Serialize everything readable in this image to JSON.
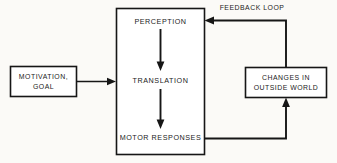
{
  "diagram": {
    "background_color": "#fbfaf7",
    "line_color": "#161616",
    "box_fill": "#ffffff",
    "boxes": {
      "motivation": {
        "line1": "MOTIVATION,",
        "line2": "GOAL"
      },
      "process": {
        "stage1": "PERCEPTION",
        "stage2": "TRANSLATION",
        "stage3": "MOTOR RESPONSES"
      },
      "outside_world": {
        "line1": "CHANGES IN",
        "line2": "OUTSIDE WORLD"
      }
    },
    "labels": {
      "feedback_loop": "FEEDBACK LOOP"
    }
  }
}
